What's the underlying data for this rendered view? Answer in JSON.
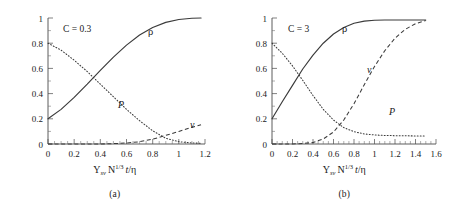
{
  "figure": {
    "panels": [
      {
        "id": "a",
        "subcaption": "(a)",
        "condition_label": "C = 0.3",
        "xlabel_parts": {
          "y": "Y",
          "y_sub": "sv",
          "n": "N",
          "n_sup": "1/3",
          "t": "t",
          "slash": "/",
          "eta": "η"
        },
        "xticks": [
          "0",
          "0.2",
          "0.4",
          "0.6",
          "0.8",
          "1",
          "1.2"
        ],
        "yticks": [
          "0",
          "0.2",
          "0.4",
          "0.6",
          "0.8",
          "1"
        ],
        "curve_labels": {
          "rho": "ρ",
          "p": "P",
          "nu": "ν"
        }
      },
      {
        "id": "b",
        "subcaption": "(b)",
        "condition_label": "C = 3",
        "xlabel_parts": {
          "y": "Y",
          "y_sub": "sv",
          "n": "N",
          "n_sup": "1/3",
          "t": "t",
          "slash": "/",
          "eta": "η"
        },
        "xticks": [
          "0",
          "0.2",
          "0.4",
          "0.6",
          "0.8",
          "1",
          "1.2",
          "1.4",
          "1.6"
        ],
        "yticks": [
          "0",
          "0.2",
          "0.4",
          "0.6",
          "0.8",
          "1"
        ],
        "curve_labels": {
          "rho": "ρ",
          "p": "P",
          "nu": "ν"
        }
      }
    ]
  },
  "chart_data": [
    {
      "type": "line",
      "title": "C = 0.3",
      "subcaption": "(a)",
      "xlabel": "Y_sv N^(1/3) t/η",
      "ylabel": "",
      "xlim": [
        0,
        1.2
      ],
      "ylim": [
        0,
        1
      ],
      "xticks": [
        0,
        0.2,
        0.4,
        0.6,
        0.8,
        1,
        1.2
      ],
      "yticks": [
        0,
        0.2,
        0.4,
        0.6,
        0.8,
        1
      ],
      "grid": false,
      "legend": "inline-curve-labels",
      "annotations": [
        "C = 0.3",
        "ρ",
        "P",
        "ν"
      ],
      "x": [
        0,
        0.1,
        0.2,
        0.3,
        0.4,
        0.5,
        0.6,
        0.7,
        0.8,
        0.9,
        1.0,
        1.1,
        1.17
      ],
      "series": [
        {
          "name": "ρ",
          "style": "solid",
          "values": [
            0.2,
            0.275,
            0.37,
            0.475,
            0.585,
            0.69,
            0.785,
            0.865,
            0.925,
            0.965,
            0.988,
            0.998,
            1.0
          ]
        },
        {
          "name": "P",
          "style": "dotted",
          "values": [
            0.8,
            0.745,
            0.665,
            0.575,
            0.475,
            0.375,
            0.275,
            0.185,
            0.105,
            0.045,
            0.018,
            0.008,
            0.006
          ]
        },
        {
          "name": "ν",
          "style": "dashed",
          "values": [
            0.0,
            0.0,
            0.0,
            0.0,
            0.0,
            0.003,
            0.008,
            0.018,
            0.038,
            0.068,
            0.1,
            0.132,
            0.152
          ]
        }
      ]
    },
    {
      "type": "line",
      "title": "C = 3",
      "subcaption": "(b)",
      "xlabel": "Y_sv N^(1/3) t/η",
      "ylabel": "",
      "xlim": [
        0,
        1.6
      ],
      "ylim": [
        0,
        1
      ],
      "xticks": [
        0,
        0.2,
        0.4,
        0.6,
        0.8,
        1,
        1.2,
        1.4,
        1.6
      ],
      "yticks": [
        0,
        0.2,
        0.4,
        0.6,
        0.8,
        1
      ],
      "grid": false,
      "legend": "inline-curve-labels",
      "annotations": [
        "C = 3",
        "ρ",
        "P",
        "ν"
      ],
      "x": [
        0,
        0.1,
        0.2,
        0.3,
        0.4,
        0.5,
        0.6,
        0.7,
        0.8,
        0.9,
        1.0,
        1.1,
        1.2,
        1.3,
        1.4,
        1.5
      ],
      "series": [
        {
          "name": "ρ",
          "style": "solid",
          "values": [
            0.2,
            0.335,
            0.465,
            0.595,
            0.705,
            0.8,
            0.873,
            0.925,
            0.958,
            0.975,
            0.982,
            0.984,
            0.984,
            0.984,
            0.984,
            0.984
          ]
        },
        {
          "name": "P",
          "style": "dotted",
          "values": [
            0.8,
            0.72,
            0.62,
            0.505,
            0.385,
            0.275,
            0.19,
            0.13,
            0.098,
            0.08,
            0.072,
            0.068,
            0.066,
            0.065,
            0.064,
            0.064
          ]
        },
        {
          "name": "ν",
          "style": "dashed",
          "values": [
            0.0,
            0.0,
            0.0,
            0.004,
            0.012,
            0.04,
            0.095,
            0.19,
            0.32,
            0.47,
            0.615,
            0.74,
            0.84,
            0.91,
            0.955,
            0.98
          ]
        }
      ]
    }
  ]
}
